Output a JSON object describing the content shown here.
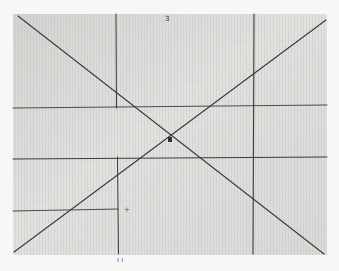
{
  "image": {
    "description": "Photograph of a sheet of graph paper with hand-drawn pencil lines: two crossing diagonals forming an X, plus several horizontal and vertical construction lines.",
    "paper_color": "#d9d9d7",
    "grid_color": "#c6c6c4",
    "line_color": "#3a3a3a",
    "background_color": "#f7f7f6"
  },
  "annotations": {
    "top_mark": "3",
    "center_mark": "▪",
    "small_cross": "+",
    "bottom_marks": "ı ı"
  }
}
